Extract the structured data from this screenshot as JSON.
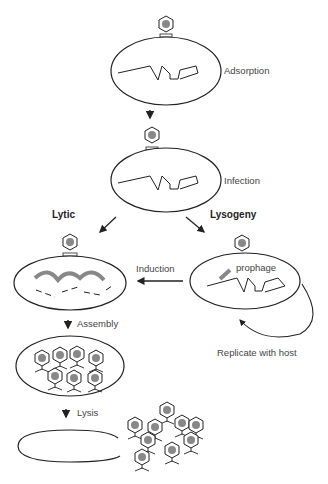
{
  "diagram": {
    "stages": {
      "adsorption": "Adsorption",
      "infection": "Infection",
      "lytic": "Lytic",
      "lysogeny": "Lysogeny",
      "induction": "Induction",
      "prophage": "prophage",
      "replicate": "Replicate with host",
      "assembly": "Assembly",
      "lysis": "Lysis"
    },
    "colors": {
      "line": "#222222",
      "dna_phage": "#888888"
    }
  }
}
